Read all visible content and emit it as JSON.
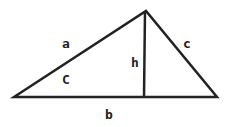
{
  "diagram": {
    "title": "",
    "stroke_color": "#222222",
    "background": "#ffffff",
    "vertices": {
      "left": [
        14,
        97
      ],
      "apex": [
        146,
        11
      ],
      "right": [
        217,
        97
      ],
      "foot": [
        144,
        97
      ]
    },
    "labels": {
      "side_a": "a",
      "side_b": "b",
      "side_c": "c",
      "height": "h",
      "angle_C": "C"
    }
  }
}
